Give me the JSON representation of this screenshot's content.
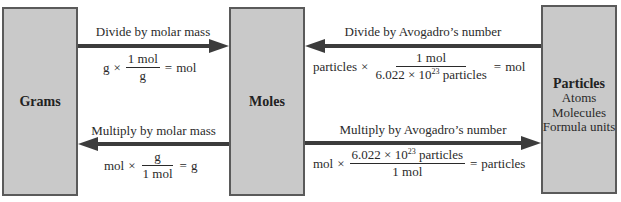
{
  "boxes": {
    "grams": {
      "title": "Grams"
    },
    "moles": {
      "title": "Moles"
    },
    "particles": {
      "title": "Particles",
      "items": [
        "Atoms",
        "Molecules",
        "Formula units"
      ]
    }
  },
  "conversions": {
    "grams_to_moles": {
      "label": "Divide by molar mass",
      "lhs": "g",
      "times": "×",
      "numerator": "1 mol",
      "denominator": "g",
      "equals": "=",
      "result": "mol",
      "direction": "right"
    },
    "particles_to_moles": {
      "label": "Divide by Avogadro’s number",
      "lhs": "particles",
      "times": "×",
      "numerator": "1 mol",
      "denominator_pre": "6.022 × 10",
      "denominator_exp": "23",
      "denominator_post": "particles",
      "equals": "=",
      "result": "mol",
      "direction": "left"
    },
    "moles_to_grams": {
      "label": "Multiply by molar mass",
      "lhs": "mol",
      "times": "×",
      "numerator": "g",
      "denominator": "1 mol",
      "equals": "=",
      "result": "g",
      "direction": "left"
    },
    "moles_to_particles": {
      "label": "Multiply by Avogadro’s number",
      "lhs": "mol",
      "times": "×",
      "numerator_pre": "6.022 × 10",
      "numerator_exp": "23",
      "numerator_post": "particles",
      "denominator": "1 mol",
      "equals": "=",
      "result": "particles",
      "direction": "right"
    }
  },
  "colors": {
    "box_fill": "#c9c9c9",
    "box_border": "#5a5a5a",
    "arrow": "#3c3c3c",
    "text": "#2a2a2a"
  }
}
